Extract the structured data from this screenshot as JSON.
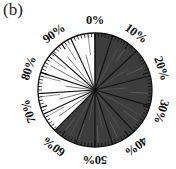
{
  "panel": {
    "label": "(b)"
  },
  "figure": {
    "name": "circular-rose-diagram",
    "center_x": 95,
    "center_y": 90,
    "radius": 57,
    "outline_color": "#111111",
    "fill_dark": "#3d3d3d",
    "fill_light": "#ffffff",
    "tick_color": "#111111",
    "spoke_color": "#111111"
  },
  "axis": {
    "labels": [
      {
        "text": "0%",
        "value": 0,
        "angle_deg": 0
      },
      {
        "text": "10%",
        "value": 10,
        "angle_deg": 36
      },
      {
        "text": "20%",
        "value": 20,
        "angle_deg": 72
      },
      {
        "text": "30%",
        "value": 30,
        "angle_deg": 108
      },
      {
        "text": "40%",
        "value": 40,
        "angle_deg": 144
      },
      {
        "text": "50%",
        "value": 50,
        "angle_deg": 180
      },
      {
        "text": "60%",
        "value": 60,
        "angle_deg": 216
      },
      {
        "text": "70%",
        "value": 70,
        "angle_deg": 252
      },
      {
        "text": "80%",
        "value": 80,
        "angle_deg": 288
      },
      {
        "text": "90%",
        "value": 90,
        "angle_deg": 324
      }
    ],
    "major_tick_count": 10,
    "minor_tick_count": 100,
    "direction": "clockwise",
    "zero_position": "top"
  },
  "chart_data": {
    "type": "pie",
    "title": "",
    "subtitle": "",
    "xlabel": "",
    "ylabel": "",
    "units": "percent",
    "total": 100,
    "categories": [
      "0-5%",
      "5-13%",
      "13-21%",
      "21-29%",
      "29-37%",
      "37-45%",
      "45-50%",
      "50-55%",
      "55-62%",
      "62-71%",
      "71-80%",
      "80-90%",
      "90-100%"
    ],
    "slices": [
      {
        "label": "sector-1",
        "start_pct": 0,
        "end_pct": 5,
        "fill": "dark"
      },
      {
        "label": "sector-2",
        "start_pct": 5,
        "end_pct": 13,
        "fill": "dark"
      },
      {
        "label": "sector-3",
        "start_pct": 13,
        "end_pct": 21,
        "fill": "dark"
      },
      {
        "label": "sector-4",
        "start_pct": 21,
        "end_pct": 29.5,
        "fill": "dark"
      },
      {
        "label": "sector-5",
        "start_pct": 29.5,
        "end_pct": 38,
        "fill": "dark"
      },
      {
        "label": "sector-6",
        "start_pct": 38,
        "end_pct": 45,
        "fill": "dark"
      },
      {
        "label": "sector-7",
        "start_pct": 45,
        "end_pct": 50,
        "fill": "dark"
      },
      {
        "label": "sector-8",
        "start_pct": 50,
        "end_pct": 55.5,
        "fill": "dark"
      },
      {
        "label": "sector-9",
        "start_pct": 55.5,
        "end_pct": 62.5,
        "fill": "dark"
      },
      {
        "label": "sector-10",
        "start_pct": 62.5,
        "end_pct": 68,
        "fill": "light"
      },
      {
        "label": "sector-11",
        "start_pct": 68,
        "end_pct": 74,
        "fill": "light"
      },
      {
        "label": "sector-12",
        "start_pct": 74,
        "end_pct": 80,
        "fill": "light"
      },
      {
        "label": "sector-13",
        "start_pct": 80,
        "end_pct": 86.5,
        "fill": "light"
      },
      {
        "label": "sector-14",
        "start_pct": 86.5,
        "end_pct": 93,
        "fill": "light"
      },
      {
        "label": "sector-15",
        "start_pct": 93,
        "end_pct": 100,
        "fill": "light"
      }
    ],
    "dark_span_pct": 62.5,
    "light_span_pct": 37.5,
    "inner_radial_lines_pct": [
      3,
      8,
      16,
      24,
      33,
      41,
      47,
      53,
      58,
      65,
      71,
      77,
      83,
      89,
      96
    ],
    "grid": false,
    "legend": "none"
  }
}
